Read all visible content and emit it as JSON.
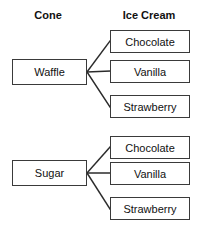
{
  "diagram": {
    "type": "tree-diagram",
    "headers": {
      "left": "Cone",
      "right": "Ice Cream"
    },
    "colors": {
      "background": "#ffffff",
      "box_border": "#3a3a3a",
      "connector": "#2b2b2b",
      "text": "#111111"
    },
    "groups": [
      {
        "cone": "Waffle",
        "flavors": [
          "Chocolate",
          "Vanilla",
          "Strawberry"
        ]
      },
      {
        "cone": "Sugar",
        "flavors": [
          "Chocolate",
          "Vanilla",
          "Strawberry"
        ]
      }
    ]
  }
}
